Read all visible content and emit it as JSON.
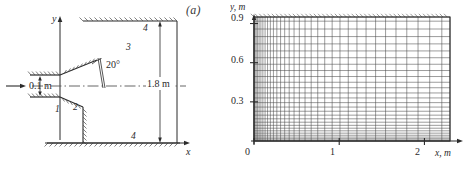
{
  "figure": {
    "panels": [
      {
        "key": "a",
        "label": "(a)",
        "name": "geometry-schematic",
        "axis": {
          "x_label": "x",
          "y_label": "y"
        },
        "dimensions": [
          {
            "name": "inlet-height",
            "text": "0.1 m"
          },
          {
            "name": "chamber-height",
            "text": "1.8 m"
          },
          {
            "name": "deflection-angle",
            "text": "20°"
          }
        ],
        "region_labels": [
          {
            "name": "region-1",
            "text": "1"
          },
          {
            "name": "region-2",
            "text": "2"
          },
          {
            "name": "region-3",
            "text": "3"
          },
          {
            "name": "region-4-top",
            "text": "4"
          },
          {
            "name": "region-4-bottom",
            "text": "4"
          }
        ]
      },
      {
        "key": "b",
        "label": "(b)",
        "name": "computational-mesh",
        "axis": {
          "x_label": "x, m",
          "y_label": "y, m",
          "x_ticks": [
            "0",
            "1",
            "2"
          ],
          "x_tick_values": [
            0,
            1,
            2
          ],
          "y_ticks": [
            "0.3",
            "0.6",
            "0.9"
          ],
          "y_tick_values": [
            0.3,
            0.6,
            0.9
          ],
          "x_origin_label": "0",
          "xlim": [
            0,
            2.3
          ],
          "ylim": [
            0,
            0.95
          ]
        }
      }
    ]
  },
  "chart_data": {
    "type": "mesh",
    "title": "",
    "panels": [
      {
        "id": "a",
        "type": "schematic",
        "title": "(a)",
        "description": "Axisymmetric sudden-expansion chamber geometry with 20-degree deflected inlet lip",
        "xlabel": "x",
        "ylabel": "y",
        "annotations": [
          "0.1 m",
          "1.8 m",
          "20°",
          "1",
          "2",
          "3",
          "4",
          "4"
        ],
        "boundaries": {
          "inlet_half_height_m": 0.1,
          "chamber_height_m": 1.8,
          "deflection_angle_deg": 20
        }
      },
      {
        "id": "b",
        "type": "mesh",
        "title": "(b)",
        "xlabel": "x, m",
        "ylabel": "y, m",
        "xlim": [
          0,
          2.3
        ],
        "ylim": [
          0,
          0.95
        ],
        "xticks": [
          0,
          1,
          2
        ],
        "yticks": [
          0.3,
          0.6,
          0.9
        ],
        "grid": true,
        "nx_cells": 38,
        "ny_cells": 26,
        "x_clustering": "fine near x = 0, stretching toward x = 2.3",
        "y_clustering": "fine near y = 0, stretching toward y = 0.95",
        "x_gridlines": [
          0.0,
          0.012,
          0.026,
          0.042,
          0.06,
          0.081,
          0.104,
          0.13,
          0.159,
          0.192,
          0.228,
          0.268,
          0.312,
          0.36,
          0.413,
          0.47,
          0.532,
          0.599,
          0.671,
          0.748,
          0.83,
          0.917,
          1.009,
          1.106,
          1.208,
          1.315,
          1.427,
          1.544,
          1.666,
          1.793,
          1.925,
          2.062,
          2.204,
          2.3
        ],
        "y_gridlines": [
          0.0,
          0.008,
          0.018,
          0.03,
          0.044,
          0.06,
          0.078,
          0.098,
          0.12,
          0.144,
          0.17,
          0.198,
          0.228,
          0.26,
          0.294,
          0.33,
          0.368,
          0.408,
          0.45,
          0.494,
          0.54,
          0.588,
          0.638,
          0.69,
          0.744,
          0.8,
          0.858,
          0.918,
          0.95
        ]
      }
    ]
  },
  "colors": {
    "line": "#2b2b2b",
    "mesh": "#4a4a4a",
    "text": "#2b2b2b",
    "background": "#ffffff"
  }
}
